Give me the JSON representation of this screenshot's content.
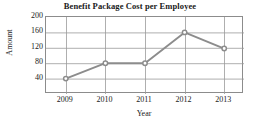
{
  "chart_data": {
    "type": "line",
    "title": "Benefit Package Cost per Employee",
    "xlabel": "Year",
    "ylabel": "Amount",
    "categories": [
      "2009",
      "2010",
      "2011",
      "2012",
      "2013"
    ],
    "values": [
      40,
      80,
      80,
      160,
      118
    ],
    "series": [
      {
        "name": "Benefit Package Cost",
        "values": [
          40,
          80,
          80,
          160,
          118
        ]
      }
    ],
    "ylim": [
      0,
      200
    ],
    "yticks": [
      40,
      80,
      120,
      160,
      200
    ],
    "ytick_labels": [
      "40",
      "80",
      "120",
      "160",
      "200"
    ],
    "xtick_labels": [
      "2009",
      "2010",
      "2011",
      "2012",
      "2013"
    ],
    "grid": true,
    "grid_axes": "both",
    "legend": false,
    "legend_position": "none",
    "marker": "circle",
    "line_color": "#8c8c8c",
    "marker_color": "#8c8c8c",
    "grid_color": "#9a9a9a",
    "frame_color": "#8c8c8c",
    "text_color": "#1a1a1a",
    "background": "#ffffff"
  }
}
